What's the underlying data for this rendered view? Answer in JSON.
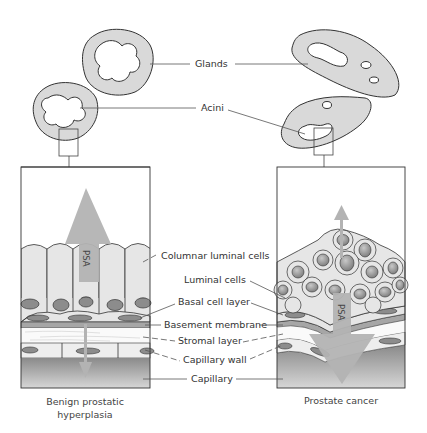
{
  "top_labels": {
    "glands": "Glands",
    "acini": "Acini"
  },
  "center_labels": {
    "columnar_luminal_cells": "Columnar luminal cells",
    "luminal_cells": "Luminal cells",
    "basal_cell_layer": "Basal cell layer",
    "basement_membrane": "Basement membrane",
    "stromal_layer": "Stromal layer",
    "capillary_wall": "Capillary wall",
    "capillary": "Capillary"
  },
  "panels": {
    "left": {
      "caption_line1": "Benign prostatic",
      "caption_line2": "hyperplasia",
      "arrow_label": "PSA",
      "arrow_direction": "mostly upward into lumen (large), small downward into capillary"
    },
    "right": {
      "caption": "Prostate cancer",
      "arrow_label": "PSA",
      "arrow_direction": "mostly downward into capillary (large), small upward into lumen"
    }
  },
  "colors": {
    "gland_fill": "#d9d9d9",
    "cell_fill": "#e6e6e6",
    "nucleus_fill": "#8c8c8c",
    "arrow_fill": "#b3b3b3",
    "capillary_top": "#8a8a8a",
    "capillary_bottom": "#d6d6d6",
    "outline": "#333333"
  }
}
